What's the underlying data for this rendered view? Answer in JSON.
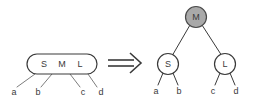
{
  "diagram": {
    "colors": {
      "stroke": "#3a3a3a",
      "leaf_stroke": "#7d7d7d",
      "node_fill_white": "#ffffff",
      "node_fill_gray": "#a9a9a9",
      "background": "#ffffff"
    },
    "left": {
      "box_label_1": "S",
      "box_label_2": "M",
      "box_label_3": "L",
      "children": [
        "a",
        "b",
        "c",
        "d"
      ]
    },
    "operator": {
      "symbol": "double-right-arrow"
    },
    "right": {
      "root_label": "M",
      "left_child_label": "S",
      "right_child_label": "L",
      "left_leaves": [
        "a",
        "b"
      ],
      "right_leaves": [
        "c",
        "d"
      ]
    }
  }
}
